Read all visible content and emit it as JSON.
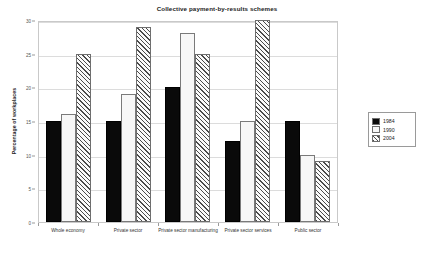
{
  "chart_data": {
    "type": "bar",
    "title": "Collective payment-by-results schemes",
    "xlabel": "",
    "ylabel": "Percentage of workplaces",
    "ylim": [
      0,
      30
    ],
    "yticks": [
      0,
      5,
      10,
      15,
      20,
      25,
      30
    ],
    "ytick_labels": [
      "0",
      "5",
      "10",
      "15",
      "20",
      "25",
      "30"
    ],
    "grid": true,
    "legend_position": "right",
    "categories": [
      "Whole economy",
      "Private sector",
      "Private sector manufacturing",
      "Private sector services",
      "Public sector"
    ],
    "series": [
      {
        "name": "1984",
        "color": "#0a0a0a",
        "pattern": "solid-black",
        "values": [
          15,
          15,
          20,
          12,
          15
        ]
      },
      {
        "name": "1990",
        "color": "#f7f7f7",
        "pattern": "white-dotted",
        "values": [
          16,
          19,
          28,
          15,
          10
        ]
      },
      {
        "name": "2004",
        "color": "#fafafa",
        "pattern": "diagonal-hatch",
        "values": [
          25,
          29,
          25,
          30,
          9
        ]
      }
    ]
  },
  "legend": {
    "items": [
      {
        "label": "1984"
      },
      {
        "label": "1990"
      },
      {
        "label": "2004"
      }
    ]
  },
  "colors": {
    "series_1984": "#0a0a0a",
    "series_1990": "#f7f7f7",
    "series_2004": "#fafafa",
    "gridline": "#dcdcdc",
    "axis": "#9a9a9a",
    "background": "#ffffff"
  }
}
